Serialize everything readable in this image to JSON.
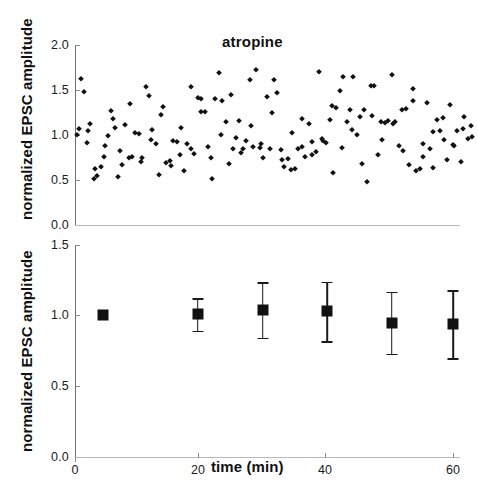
{
  "figure": {
    "title": "atropine",
    "background": "#ffffff",
    "marker_color": "#111111",
    "axis_color": "#6e6e6e"
  },
  "chart_data": [
    {
      "type": "scatter",
      "panel": "top",
      "title": "atropine",
      "xlabel": "",
      "ylabel": "normalized EPSC amplitude",
      "xlim": [
        0,
        63.5
      ],
      "ylim": [
        0.0,
        2.0
      ],
      "yticks": [
        "0.0",
        "0.5",
        "1.0",
        "1.5",
        "2.0"
      ],
      "ytick_values": [
        0.0,
        0.5,
        1.0,
        1.5,
        2.0
      ],
      "xticks": [],
      "grid": false,
      "legend": "none",
      "marker": "diamond",
      "x": [
        0.3,
        0.6,
        0.9,
        1.4,
        1.9,
        2.4,
        3.0,
        3.5,
        4.1,
        4.6,
        5.2,
        5.7,
        6.3,
        6.8,
        7.4,
        7.9,
        8.5,
        9.0,
        9.6,
        10.1,
        10.7,
        11.2,
        11.8,
        12.3,
        12.9,
        13.4,
        14.0,
        14.5,
        15.1,
        15.6,
        16.2,
        16.7,
        17.3,
        17.8,
        18.4,
        18.9,
        19.5,
        20.0,
        20.6,
        21.1,
        21.7,
        22.2,
        22.8,
        23.3,
        23.9,
        24.4,
        25.0,
        25.5,
        26.1,
        26.6,
        27.2,
        27.7,
        28.3,
        28.8,
        29.4,
        29.9,
        30.5,
        31.0,
        31.6,
        32.1,
        32.7,
        33.2,
        33.8,
        34.3,
        34.9,
        35.4,
        36.0,
        36.5,
        37.1,
        37.6,
        38.2,
        38.7,
        39.3,
        39.8,
        40.4,
        40.9,
        41.5,
        42.0,
        42.6,
        43.1,
        43.7,
        44.2,
        44.8,
        45.3,
        45.9,
        46.4,
        47.0,
        47.5,
        48.1,
        48.6,
        49.2,
        49.7,
        50.3,
        50.8,
        51.4,
        51.9,
        52.5,
        53.0,
        53.6,
        54.1,
        54.7,
        55.2,
        55.8,
        56.3,
        56.9,
        57.4,
        58.0,
        58.5,
        59.1,
        59.6,
        60.2,
        60.7,
        61.3,
        61.8,
        62.4,
        62.9,
        2.0,
        3.2,
        4.8,
        6.0,
        7.2,
        8.8,
        10.4,
        12.0,
        13.6,
        15.2,
        16.8,
        18.4,
        20.0,
        21.6,
        23.2,
        24.8,
        26.4,
        28.0,
        29.6,
        31.2,
        32.8,
        34.4,
        36.0,
        37.6,
        39.2,
        40.8,
        42.4,
        44.0,
        45.6,
        47.2,
        48.8,
        50.4,
        52.0,
        53.6,
        55.2,
        56.8,
        58.4,
        60.0,
        61.6,
        63.0
      ],
      "y": [
        1.0,
        1.07,
        1.62,
        1.48,
        0.91,
        1.12,
        0.51,
        0.55,
        0.64,
        0.76,
        0.99,
        1.27,
        1.08,
        0.53,
        0.67,
        1.11,
        0.74,
        0.76,
        1.02,
        1.01,
        0.75,
        1.53,
        1.43,
        1.06,
        0.9,
        0.56,
        1.31,
        0.69,
        0.71,
        0.93,
        0.92,
        0.78,
        0.6,
        0.9,
        1.53,
        0.79,
        1.41,
        1.4,
        1.26,
        0.87,
        0.51,
        1.4,
        1.69,
        1.38,
        1.15,
        0.68,
        0.85,
        0.97,
        1.16,
        0.85,
        0.93,
        1.61,
        0.87,
        1.72,
        0.86,
        0.75,
        1.42,
        0.85,
        1.61,
        1.47,
        0.83,
        0.65,
        0.73,
        0.61,
        0.62,
        0.84,
        0.87,
        0.76,
        1.12,
        0.92,
        0.81,
        1.7,
        0.93,
        0.91,
        1.17,
        0.58,
        1.3,
        1.49,
        1.64,
        1.14,
        1.28,
        1.65,
        1.0,
        1.2,
        1.28,
        0.48,
        1.54,
        1.55,
        0.78,
        1.15,
        1.13,
        1.16,
        1.67,
        1.14,
        0.88,
        1.28,
        1.29,
        0.67,
        1.51,
        0.6,
        0.62,
        0.9,
        1.36,
        0.84,
        0.63,
        1.17,
        1.05,
        0.95,
        0.72,
        1.33,
        0.88,
        1.04,
        0.7,
        1.2,
        0.96,
        1.1,
        1.05,
        0.62,
        0.88,
        1.18,
        0.82,
        1.35,
        0.7,
        0.95,
        1.22,
        0.66,
        1.08,
        0.84,
        1.26,
        0.74,
        1.0,
        1.44,
        0.8,
        1.1,
        0.9,
        1.24,
        0.72,
        1.02,
        1.18,
        0.78,
        0.96,
        1.32,
        0.86,
        1.06,
        0.68,
        1.21,
        0.94,
        1.12,
        0.82,
        1.38,
        0.76,
        1.03,
        1.19,
        0.89,
        1.07,
        0.98
      ]
    },
    {
      "type": "scatter",
      "panel": "bottom",
      "title": "",
      "xlabel": "time (min)",
      "ylabel": "normalized EPSC amplitude",
      "xlim": [
        0,
        63.5
      ],
      "ylim": [
        0.0,
        1.5
      ],
      "yticks": [
        "0.0",
        "0.5",
        "1.0",
        "1.5"
      ],
      "ytick_values": [
        0.0,
        0.5,
        1.0,
        1.5
      ],
      "xticks": [
        "0",
        "20",
        "40",
        "60"
      ],
      "xtick_values": [
        0,
        20,
        40,
        60
      ],
      "grid": false,
      "legend": "none",
      "marker": "square",
      "errorbars": true,
      "x": [
        4.5,
        19.5,
        29.8,
        40.0,
        50.3,
        60.0
      ],
      "y": [
        1.005,
        1.01,
        1.04,
        1.03,
        0.95,
        0.94
      ],
      "yerr": [
        0.0,
        0.115,
        0.195,
        0.21,
        0.22,
        0.24
      ]
    }
  ]
}
